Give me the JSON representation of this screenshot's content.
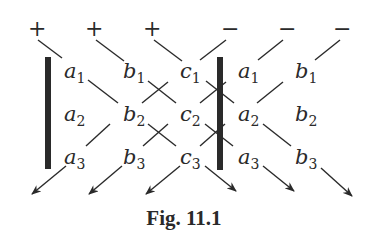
{
  "figure": {
    "caption": "Fig. 11.1",
    "signs": {
      "plus": [
        "+",
        "+",
        "+"
      ],
      "minus": [
        "−",
        "−",
        "−"
      ]
    },
    "grid": {
      "rows": [
        {
          "cols": [
            {
              "l": "a",
              "s": "1"
            },
            {
              "l": "b",
              "s": "1"
            },
            {
              "l": "c",
              "s": "1"
            },
            {
              "l": "a",
              "s": "1"
            },
            {
              "l": "b",
              "s": "1"
            }
          ]
        },
        {
          "cols": [
            {
              "l": "a",
              "s": "2"
            },
            {
              "l": "b",
              "s": "2"
            },
            {
              "l": "c",
              "s": "2"
            },
            {
              "l": "a",
              "s": "2"
            },
            {
              "l": "b",
              "s": "2"
            }
          ]
        },
        {
          "cols": [
            {
              "l": "a",
              "s": "3"
            },
            {
              "l": "b",
              "s": "3"
            },
            {
              "l": "c",
              "s": "3"
            },
            {
              "l": "a",
              "s": "3"
            },
            {
              "l": "b",
              "s": "3"
            }
          ]
        }
      ]
    },
    "colors": {
      "ink": "#2a2a2a",
      "background": "#ffffff"
    }
  }
}
